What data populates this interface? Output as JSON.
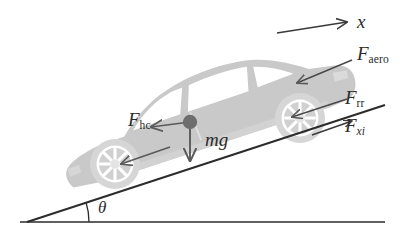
{
  "figure": {
    "type": "free-body-diagram",
    "background_color": "#ffffff",
    "ink_color": "#2b2b2b",
    "car_body_color": "#c9c9c9",
    "car_window_color": "#ffffff",
    "wheel_rim_color": "#d8d8d8",
    "wheel_spoke_color": "#ffffff",
    "com_dot_color": "#6e6e6e",
    "arrow_color": "#4a4a4a",
    "line_color": "#2b2b2b"
  },
  "labels": {
    "axis_x": {
      "base": "x",
      "sub": "",
      "name": "x-axis-label"
    },
    "f_aero": {
      "base": "F",
      "sub": "aero",
      "name": "f-aero-label"
    },
    "f_rr": {
      "base": "F",
      "sub": "rr",
      "name": "f-rr-label"
    },
    "f_xi": {
      "base": "F",
      "sub": "xi",
      "name": "f-xi-label"
    },
    "f_hc": {
      "base": "F",
      "sub": "hc",
      "name": "f-hc-label"
    },
    "mg": {
      "base": "mg",
      "sub": "",
      "name": "mg-label"
    },
    "theta": {
      "base": "θ",
      "sub": "",
      "name": "theta-label"
    }
  },
  "forces": [
    {
      "symbol": "F_aero",
      "display": "F aero",
      "meaning": "aerodynamic drag force",
      "direction": "down-slope (rearward, pointing at vehicle rear)",
      "arrow_from": [
        350,
        62
      ],
      "arrow_to": [
        297,
        83
      ]
    },
    {
      "symbol": "F_rr",
      "display": "F rr",
      "meaning": "rolling resistance force",
      "direction": "down-slope (rearward, at front wheel)",
      "arrow_from": [
        345,
        100
      ],
      "arrow_to": [
        290,
        118
      ]
    },
    {
      "symbol": "F_xi",
      "display": "F xi",
      "meaning": "tractive / longitudinal drive force",
      "direction": "up-slope (forward, along incline)",
      "arrow_from": [
        310,
        133
      ],
      "arrow_to": [
        352,
        119
      ]
    },
    {
      "symbol": "F_hc",
      "display": "F hc",
      "meaning": "hill climbing resistance force component",
      "direction": "down-slope (rearward, from centre of mass)",
      "arrow_from": [
        190,
        122
      ],
      "arrow_to": [
        152,
        126
      ]
    },
    {
      "symbol": "mg",
      "display": "mg",
      "meaning": "gravitational weight of the vehicle",
      "direction": "vertically downward from centre of mass",
      "arrow_from": [
        190,
        122
      ],
      "arrow_to": [
        190,
        160
      ]
    },
    {
      "symbol": "F_rr_rear",
      "display": "",
      "meaning": "rolling resistance at rear wheel (unlabelled arrow)",
      "direction": "down-slope (rearward, at rear wheel)",
      "arrow_from": [
        168,
        146
      ],
      "arrow_to": [
        118,
        163
      ]
    }
  ],
  "geometry": {
    "incline_angle_symbol": "θ",
    "incline_apex": [
      27,
      222
    ],
    "incline_top_end": [
      385,
      105
    ],
    "ground_line_from": [
      20,
      222
    ],
    "ground_line_to": [
      385,
      222
    ],
    "x_axis_arrow_from": [
      277,
      32
    ],
    "x_axis_arrow_to": [
      349,
      22
    ],
    "centre_of_mass": [
      190,
      122
    ],
    "front_wheel_centre": [
      300,
      118
    ],
    "rear_wheel_centre": [
      115,
      164
    ]
  },
  "annotations": {
    "angle_arc_label": "θ",
    "angle_arc_centre": [
      27,
      222
    ],
    "angle_arc_radius": 62
  }
}
